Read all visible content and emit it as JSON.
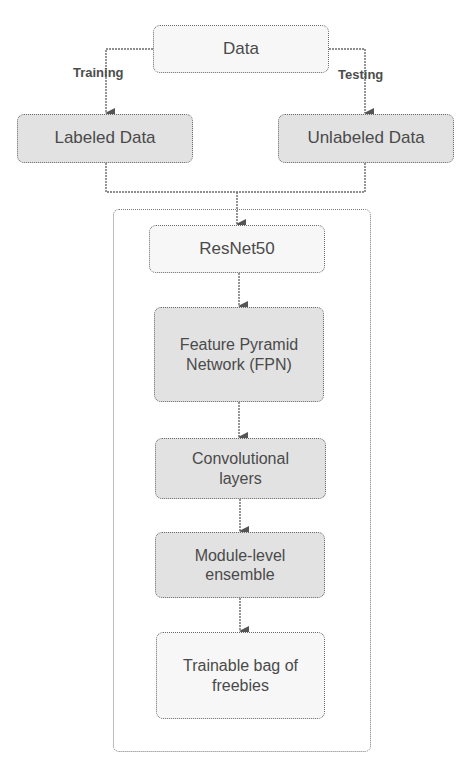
{
  "diagram": {
    "source": {
      "label": "Data"
    },
    "branches": [
      {
        "edge_label": "Training",
        "target": "Labeled Data"
      },
      {
        "edge_label": "Testing",
        "target": "Unlabeled Data"
      }
    ],
    "pipeline": {
      "stages": [
        {
          "label": "ResNet50"
        },
        {
          "label": "Feature Pyramid Network (FPN)"
        },
        {
          "label": "Convolutional layers"
        },
        {
          "label": "Module-level ensemble"
        },
        {
          "label": "Trainable bag of freebies"
        }
      ]
    }
  },
  "colors": {
    "box_fill": "#e2e2e2",
    "box_fill_light": "#f7f7f7",
    "line": "#5a5a5a",
    "text": "#4a4a4a"
  }
}
